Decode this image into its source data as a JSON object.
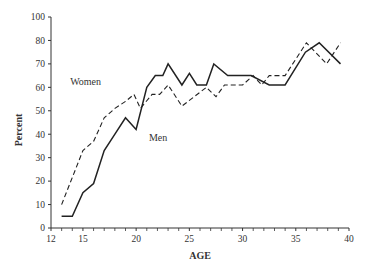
{
  "chart_data": {
    "type": "line",
    "title": "",
    "xlabel": "AGE",
    "ylabel": "Percent",
    "xlim": [
      12,
      40
    ],
    "ylim": [
      0,
      90
    ],
    "x_ticks": [
      12,
      15,
      20,
      25,
      30,
      35,
      40
    ],
    "x_minor_ticks": [
      13,
      14,
      16,
      17,
      18,
      19,
      21,
      22,
      23,
      24,
      26,
      27,
      28,
      29,
      31,
      32,
      33,
      34,
      36,
      37,
      38,
      39
    ],
    "y_ticks": [
      {
        "value": 0,
        "label": "0"
      },
      {
        "value": 10,
        "label": "10"
      },
      {
        "value": 20,
        "label": "20"
      },
      {
        "value": 30,
        "label": "30"
      },
      {
        "value": 40,
        "label": "40"
      },
      {
        "value": 50,
        "label": "50"
      },
      {
        "value": 60,
        "label": "60"
      },
      {
        "value": 70,
        "label": "70"
      },
      {
        "value": 80,
        "label": "80"
      },
      {
        "value": 90,
        "label": "100"
      }
    ],
    "grid": false,
    "legend": "inline labels",
    "series": [
      {
        "name": "Men",
        "style": "solid",
        "label_position": {
          "x": 21.2,
          "y": 37
        },
        "points": [
          [
            13,
            5
          ],
          [
            14,
            5
          ],
          [
            15,
            15
          ],
          [
            16,
            19
          ],
          [
            17,
            33
          ],
          [
            18,
            40
          ],
          [
            19,
            47
          ],
          [
            20,
            42
          ],
          [
            21,
            60
          ],
          [
            21.8,
            65
          ],
          [
            22.5,
            65
          ],
          [
            23,
            70
          ],
          [
            24.3,
            61
          ],
          [
            25,
            66
          ],
          [
            25.7,
            61
          ],
          [
            26.6,
            61
          ],
          [
            27.3,
            70
          ],
          [
            28.6,
            65
          ],
          [
            30.8,
            65
          ],
          [
            32.5,
            61
          ],
          [
            34,
            61
          ],
          [
            35.9,
            75
          ],
          [
            37.2,
            79
          ],
          [
            39.2,
            70
          ]
        ]
      },
      {
        "name": "Women",
        "style": "dashed",
        "label_position": {
          "x": 13.8,
          "y": 61
        },
        "points": [
          [
            13,
            10
          ],
          [
            15,
            33
          ],
          [
            16,
            37
          ],
          [
            17,
            47
          ],
          [
            18,
            51
          ],
          [
            19,
            54
          ],
          [
            19.8,
            57
          ],
          [
            20.4,
            51
          ],
          [
            21.5,
            57
          ],
          [
            22.2,
            57
          ],
          [
            23,
            61
          ],
          [
            24.3,
            52
          ],
          [
            26.6,
            60
          ],
          [
            27.5,
            56
          ],
          [
            28.3,
            61
          ],
          [
            30,
            61
          ],
          [
            31,
            65
          ],
          [
            31.8,
            61
          ],
          [
            32.5,
            65
          ],
          [
            34,
            65
          ],
          [
            36,
            79
          ],
          [
            37.9,
            70
          ],
          [
            39.2,
            79
          ]
        ]
      }
    ]
  },
  "axes": {
    "x_title": "AGE",
    "y_title": "Percent"
  },
  "labels": {
    "men": "Men",
    "women": "Women"
  },
  "colors": {
    "line": "#222222",
    "axis": "#333333",
    "background": "#ffffff"
  }
}
